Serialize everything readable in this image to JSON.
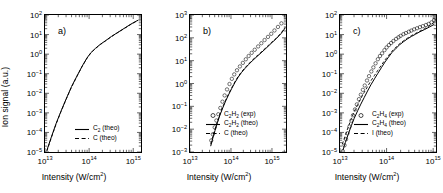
{
  "figure": {
    "axis_labels": {
      "y": "Ion signal (a.u.)",
      "x_prefix": "Intensity (W/cm",
      "x_exp": "2",
      "x_suffix": ")"
    }
  },
  "panels": [
    {
      "tag": "a)",
      "legend": [
        {
          "style": "solid",
          "species": "C",
          "sub": "2",
          "qualifier": " (theo)"
        },
        {
          "style": "dashed",
          "species": "C",
          "sub": "",
          "qualifier": " (theo)"
        }
      ]
    },
    {
      "tag": "b)",
      "legend": [
        {
          "style": "circle",
          "species": "C",
          "sub": "2",
          "species2": "H",
          "sub2": "2",
          "qualifier": " (exp)"
        },
        {
          "style": "solid",
          "species": "C",
          "sub": "2",
          "species2": "H",
          "sub2": "2",
          "qualifier": " (theo)"
        },
        {
          "style": "dashed",
          "species": "C",
          "sub": "",
          "qualifier": " (theo)"
        }
      ]
    },
    {
      "tag": "c)",
      "legend": [
        {
          "style": "circle",
          "species": "C",
          "sub": "2",
          "species2": "H",
          "sub2": "4",
          "qualifier": " (exp)"
        },
        {
          "style": "solid",
          "species": "C",
          "sub": "2",
          "species2": "H",
          "sub2": "4",
          "qualifier": " (theo)"
        },
        {
          "style": "dashed",
          "species": "I",
          "sub": "",
          "qualifier": " (theo)"
        }
      ]
    }
  ],
  "chart_data": [
    {
      "type": "line",
      "panel": "a)",
      "title": "",
      "xlabel": "Intensity (W/cm^2)",
      "ylabel": "Ion signal (a.u.)",
      "xscale": "log",
      "yscale": "log",
      "xlim": [
        10000000000000.0,
        1500000000000000.0
      ],
      "ylim": [
        1e-05,
        100.0
      ],
      "xticks": [
        10000000000000.0,
        100000000000000.0,
        1000000000000000.0
      ],
      "xticklabels": [
        "10^13",
        "10^14",
        "10^15"
      ],
      "yticks": [
        1e-05,
        0.0001,
        0.001,
        0.01,
        0.1,
        1.0,
        10.0,
        100.0
      ],
      "yticklabels": [
        "10^-5",
        "10^-4",
        "10^-3",
        "10^-2",
        "10^-1",
        "10^0",
        "10^1",
        "10^2"
      ],
      "grid": false,
      "legend_position": "lower right",
      "series": [
        {
          "name": "C2 (theo)",
          "style": "solid",
          "x": [
            11000000000000.0,
            14000000000000.0,
            18000000000000.0,
            23000000000000.0,
            30000000000000.0,
            40000000000000.0,
            52000000000000.0,
            70000000000000.0,
            90000000000000.0,
            110000000000000.0,
            140000000000000.0,
            180000000000000.0,
            240000000000000.0,
            320000000000000.0,
            450000000000000.0,
            650000000000000.0,
            900000000000000.0,
            1300000000000000.0
          ],
          "y": [
            1.2e-05,
            6e-05,
            0.0003,
            0.0012,
            0.005,
            0.022,
            0.07,
            0.25,
            0.65,
            1.2,
            2.0,
            3.2,
            5.0,
            8.0,
            13.0,
            22.0,
            35.0,
            55.0
          ]
        },
        {
          "name": "C (theo)",
          "style": "dashed",
          "x": [
            11000000000000.0,
            14000000000000.0,
            18000000000000.0,
            23000000000000.0,
            30000000000000.0,
            40000000000000.0,
            52000000000000.0,
            70000000000000.0,
            90000000000000.0,
            110000000000000.0,
            140000000000000.0,
            180000000000000.0,
            240000000000000.0,
            320000000000000.0,
            450000000000000.0,
            650000000000000.0,
            900000000000000.0,
            1300000000000000.0
          ],
          "y": [
            1.1e-05,
            5.6e-05,
            0.00028,
            0.00115,
            0.0048,
            0.021,
            0.068,
            0.24,
            0.63,
            1.15,
            1.95,
            3.1,
            4.9,
            7.8,
            12.8,
            21.5,
            34.0,
            54.0
          ]
        }
      ]
    },
    {
      "type": "line",
      "panel": "b)",
      "title": "",
      "xlabel": "Intensity (W/cm^2)",
      "ylabel": "Ion signal (a.u.)",
      "xscale": "log",
      "yscale": "log",
      "xlim": [
        10000000000000.0,
        2200000000000000.0
      ],
      "ylim": [
        0.001,
        1000.0
      ],
      "xticks": [
        10000000000000.0,
        100000000000000.0,
        1000000000000000.0
      ],
      "xticklabels": [
        "10^13",
        "10^14",
        "10^15"
      ],
      "yticks": [
        0.001,
        0.01,
        0.1,
        1.0,
        10.0,
        100.0,
        1000.0
      ],
      "yticklabels": [
        "10^-3",
        "10^-2",
        "10^-1",
        "10^0",
        "10^1",
        "10^2",
        "10^3"
      ],
      "grid": false,
      "legend_position": "lower right",
      "series": [
        {
          "name": "C2H2 (exp)",
          "style": "circle",
          "x": [
            33000000000000.0,
            36000000000000.0,
            40000000000000.0,
            44000000000000.0,
            49000000000000.0,
            55000000000000.0,
            62000000000000.0,
            70000000000000.0,
            80000000000000.0,
            92000000000000.0,
            105000000000000.0,
            120000000000000.0,
            140000000000000.0,
            165000000000000.0,
            195000000000000.0,
            230000000000000.0,
            270000000000000.0,
            320000000000000.0,
            380000000000000.0,
            460000000000000.0,
            550000000000000.0,
            660000000000000.0,
            800000000000000.0,
            960000000000000.0,
            1150000000000000.0,
            1400000000000000.0,
            1700000000000000.0
          ],
          "y": [
            0.0032,
            0.006,
            0.012,
            0.024,
            0.045,
            0.085,
            0.16,
            0.3,
            0.55,
            0.95,
            1.6,
            2.5,
            3.8,
            5.6,
            8.0,
            11.5,
            16.0,
            22.0,
            30.0,
            42.0,
            58.0,
            80.0,
            110.0,
            150.0,
            210.0,
            300.0,
            430.0
          ]
        },
        {
          "name": "C2H2 (theo)",
          "style": "solid",
          "x": [
            32000000000000.0,
            36000000000000.0,
            41000000000000.0,
            47000000000000.0,
            54000000000000.0,
            63000000000000.0,
            74000000000000.0,
            88000000000000.0,
            105000000000000.0,
            125000000000000.0,
            150000000000000.0,
            180000000000000.0,
            220000000000000.0,
            270000000000000.0,
            330000000000000.0,
            410000000000000.0,
            510000000000000.0,
            640000000000000.0,
            800000000000000.0,
            1000000000000000.0,
            1300000000000000.0,
            1700000000000000.0,
            2100000000000000.0
          ],
          "y": [
            0.0018,
            0.004,
            0.009,
            0.02,
            0.042,
            0.085,
            0.17,
            0.33,
            0.62,
            1.1,
            1.9,
            3.0,
            4.6,
            6.8,
            9.8,
            14.0,
            20.0,
            29.0,
            42.0,
            62.0,
            95.0,
            160.0,
            270.0
          ]
        },
        {
          "name": "C (theo)",
          "style": "dashed",
          "x": [
            32000000000000.0,
            36000000000000.0,
            41000000000000.0,
            47000000000000.0,
            54000000000000.0,
            63000000000000.0,
            74000000000000.0,
            88000000000000.0,
            105000000000000.0,
            125000000000000.0,
            150000000000000.0,
            180000000000000.0,
            220000000000000.0,
            270000000000000.0,
            330000000000000.0,
            410000000000000.0,
            510000000000000.0,
            640000000000000.0,
            800000000000000.0,
            1000000000000000.0,
            1300000000000000.0,
            1700000000000000.0,
            2100000000000000.0
          ],
          "y": [
            0.0022,
            0.0048,
            0.0105,
            0.023,
            0.048,
            0.095,
            0.185,
            0.36,
            0.67,
            1.2,
            2.05,
            3.2,
            4.9,
            7.2,
            10.5,
            15.0,
            21.0,
            31.0,
            45.0,
            66.0,
            100.0,
            170.0,
            290.0
          ]
        }
      ]
    },
    {
      "type": "line",
      "panel": "c)",
      "title": "",
      "xlabel": "Intensity (W/cm^2)",
      "ylabel": "Ion signal (a.u.)",
      "xscale": "log",
      "yscale": "log",
      "xlim": [
        10000000000000.0,
        1150000000000000.0
      ],
      "ylim": [
        1e-05,
        100.0
      ],
      "xticks": [
        10000000000000.0,
        100000000000000.0,
        1000000000000000.0
      ],
      "xticklabels": [
        "10^13",
        "10^14",
        "10^15"
      ],
      "yticks": [
        1e-05,
        0.0001,
        0.001,
        0.01,
        0.1,
        1.0,
        10.0,
        100.0
      ],
      "yticklabels": [
        "10^-5",
        "10^-4",
        "10^-3",
        "10^-2",
        "10^-1",
        "10^0",
        "10^1",
        "10^2"
      ],
      "grid": false,
      "legend_position": "lower right",
      "series": [
        {
          "name": "C2H4 (exp)",
          "style": "circle",
          "x": [
            11500000000000.0,
            12500000000000.0,
            13500000000000.0,
            14500000000000.0,
            16000000000000.0,
            17500000000000.0,
            19000000000000.0,
            21000000000000.0,
            23000000000000.0,
            25500000000000.0,
            28000000000000.0,
            31000000000000.0,
            34000000000000.0,
            38000000000000.0,
            42000000000000.0,
            47000000000000.0,
            52000000000000.0,
            58000000000000.0,
            65000000000000.0,
            72000000000000.0,
            80000000000000.0,
            90000000000000.0,
            100000000000000.0,
            112000000000000.0,
            125000000000000.0,
            140000000000000.0,
            160000000000000.0,
            180000000000000.0,
            200000000000000.0,
            230000000000000.0,
            260000000000000.0,
            300000000000000.0,
            340000000000000.0,
            390000000000000.0,
            450000000000000.0,
            520000000000000.0,
            600000000000000.0,
            700000000000000.0,
            800000000000000.0,
            920000000000000.0,
            1050000000000000.0
          ],
          "y": [
            1.1e-05,
            2.2e-05,
            4.5e-05,
            9e-05,
            0.0002,
            0.0004,
            0.00075,
            0.0015,
            0.0027,
            0.005,
            0.0085,
            0.015,
            0.025,
            0.045,
            0.075,
            0.13,
            0.21,
            0.34,
            0.55,
            0.8,
            1.1,
            1.6,
            2.2,
            2.9,
            3.7,
            4.7,
            6.0,
            7.3,
            8.6,
            10.5,
            12.0,
            14.0,
            16.0,
            18.5,
            21.0,
            24.0,
            27.0,
            31.0,
            35.0,
            42.0,
            55.0
          ]
        },
        {
          "name": "C2H4 (theo)",
          "style": "solid",
          "x": [
            11500000000000.0,
            13000000000000.0,
            15000000000000.0,
            17500000000000.0,
            20000000000000.0,
            24000000000000.0,
            28000000000000.0,
            33000000000000.0,
            39000000000000.0,
            46000000000000.0,
            55000000000000.0,
            65000000000000.0,
            78000000000000.0,
            92000000000000.0,
            110000000000000.0,
            130000000000000.0,
            160000000000000.0,
            190000000000000.0,
            230000000000000.0,
            280000000000000.0,
            340000000000000.0,
            420000000000000.0,
            520000000000000.0,
            650000000000000.0,
            820000000000000.0,
            1050000000000000.0
          ],
          "y": [
            1.2e-05,
            3e-05,
            8e-05,
            0.00022,
            0.0005,
            0.0013,
            0.0028,
            0.006,
            0.013,
            0.027,
            0.055,
            0.105,
            0.21,
            0.39,
            0.7,
            1.2,
            2.0,
            3.0,
            4.3,
            6.0,
            8.0,
            10.5,
            14.0,
            18.0,
            24.0,
            33.0
          ]
        },
        {
          "name": "I (theo)",
          "style": "dashed",
          "x": [
            11200000000000.0,
            13000000000000.0,
            15000000000000.0,
            17500000000000.0,
            20000000000000.0,
            24000000000000.0,
            28000000000000.0,
            33000000000000.0,
            39000000000000.0,
            46000000000000.0,
            55000000000000.0,
            65000000000000.0,
            78000000000000.0,
            92000000000000.0,
            110000000000000.0,
            130000000000000.0,
            160000000000000.0,
            190000000000000.0,
            230000000000000.0,
            280000000000000.0,
            340000000000000.0,
            420000000000000.0,
            520000000000000.0,
            650000000000000.0,
            820000000000000.0,
            1050000000000000.0
          ],
          "y": [
            2.5e-05,
            7e-05,
            0.00019,
            0.0005,
            0.0011,
            0.0027,
            0.0055,
            0.011,
            0.022,
            0.043,
            0.082,
            0.15,
            0.28,
            0.5,
            0.85,
            1.4,
            2.3,
            3.4,
            4.8,
            6.6,
            8.8,
            11.5,
            15.0,
            20.0,
            28.0,
            42.0
          ]
        }
      ]
    }
  ]
}
